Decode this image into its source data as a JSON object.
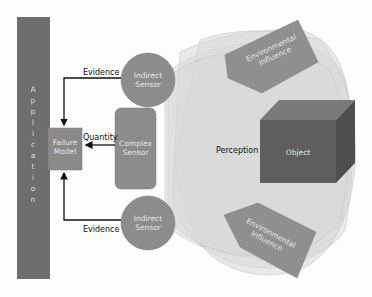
{
  "diagram": {
    "application": {
      "label": "Application",
      "letters": [
        "A",
        "p",
        "p",
        "l",
        "i",
        "c",
        "a",
        "t",
        "i",
        "o",
        "n"
      ]
    },
    "failure_model": {
      "line1": "Failure",
      "line2": "Model"
    },
    "complex_sensor": {
      "line1": "Complex",
      "line2": "Sensor"
    },
    "indirect_sensor_top": {
      "line1": "Indirect",
      "line2": "Sensor"
    },
    "indirect_sensor_bottom": {
      "line1": "Indirect",
      "line2": "Sensor"
    },
    "env_influence_top": {
      "line1": "Environmental",
      "line2": "Influence"
    },
    "env_influence_bottom": {
      "line1": "Environmental",
      "line2": "Influence"
    },
    "object": {
      "label": "Object"
    },
    "perception": {
      "label": "Perception"
    },
    "edges": {
      "evidence_top": "Evidence",
      "quantity": "Quantity",
      "evidence_bottom": "Evidence"
    },
    "colors": {
      "application": "#6e6e6e",
      "failure_model": "#8a8a8a",
      "sensor": "#8c8c8c",
      "env": "#8f8f8f",
      "object_front": "#5e5e5e",
      "object_top": "#7a7a7a",
      "object_side": "#4e4e4e",
      "perception_fill": "#dcdcdc",
      "arrow": "#111111"
    }
  }
}
